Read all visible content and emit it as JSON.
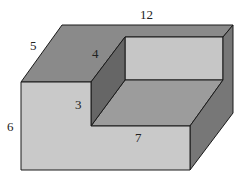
{
  "diagram": {
    "type": "3d-solid-with-notch",
    "colors": {
      "top_face": "#8a8a8a",
      "front_face": "#c9c9c9",
      "inner_back_wall": "#c6c6c6",
      "inner_floor": "#9c9c9c",
      "inner_side_wall": "#666666",
      "right_face": "#777777",
      "edge": "#1a1a1a"
    },
    "labels": {
      "length": "12",
      "depth": "5",
      "height": "6",
      "notch_depth": "4",
      "notch_height": "3",
      "notch_length": "7"
    }
  }
}
